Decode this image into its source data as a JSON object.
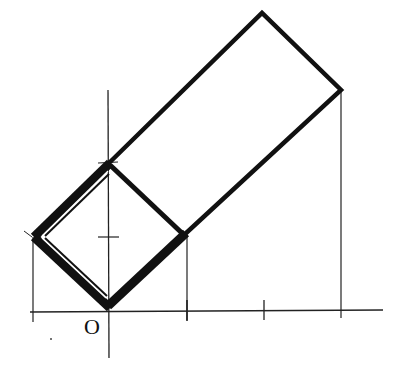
{
  "diagram": {
    "origin_label": "O",
    "colors": {
      "stroke": "#111111",
      "background": "#ffffff"
    },
    "axes": {
      "x_axis": {
        "x1": 30,
        "y1": 312,
        "x2": 383,
        "y2": 310
      },
      "y_axis": {
        "x1": 108,
        "y1": 90,
        "x2": 109,
        "y2": 358
      },
      "x_ticks": [
        33,
        187,
        264,
        341
      ],
      "y_ticks": [
        237,
        164
      ]
    },
    "square": {
      "points": [
        [
          108,
          306
        ],
        [
          34,
          237
        ],
        [
          108,
          164
        ],
        [
          184,
          235
        ]
      ]
    },
    "rectangle": {
      "points": [
        [
          108,
          164
        ],
        [
          262,
          13
        ],
        [
          341,
          90
        ],
        [
          184,
          235
        ]
      ]
    },
    "projection_lines": [
      {
        "x1": 33,
        "y1": 237,
        "x2": 33,
        "y2": 322
      },
      {
        "x1": 187,
        "y1": 235,
        "x2": 187,
        "y2": 320
      },
      {
        "x1": 341,
        "y1": 90,
        "x2": 341,
        "y2": 318
      }
    ]
  }
}
